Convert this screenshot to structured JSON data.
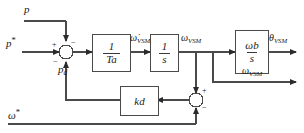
{
  "diagram": {
    "inputs": {
      "p": "p",
      "p_ref": "p",
      "p_ref_sup": "*",
      "p_damping": "p",
      "p_damping_sub": "d",
      "omega_ref": "ω",
      "omega_ref_sup": "*"
    },
    "signals": {
      "omega_dot": "ω̇",
      "omega_dot_sub": "VSM",
      "omega": "ω",
      "omega_sub": "VSM",
      "theta": "θ",
      "theta_sub": "VSM",
      "omega_out": "ω",
      "omega_out_sub": "VSM"
    },
    "blocks": [
      {
        "id": "inertia",
        "numerator": "1",
        "denominator": "T",
        "denominator_sub": "a"
      },
      {
        "id": "integrator",
        "numerator": "1",
        "denominator": "s",
        "denominator_sub": ""
      },
      {
        "id": "angle",
        "numerator": "ω",
        "numerator_sub": "b",
        "denominator": "s",
        "denominator_sub": ""
      },
      {
        "id": "damping",
        "gain": "k",
        "gain_sub": "d"
      }
    ],
    "summing_junctions": [
      {
        "id": "power-sum",
        "signs": {
          "left": "+",
          "top": "−",
          "bottom": "−"
        }
      },
      {
        "id": "speed-error-sum",
        "signs": {
          "top": "+",
          "bottom": "−"
        }
      }
    ],
    "colors": {
      "line": "#4a4a4a",
      "text": "#1a1a1a",
      "background": "#ffffff"
    }
  }
}
